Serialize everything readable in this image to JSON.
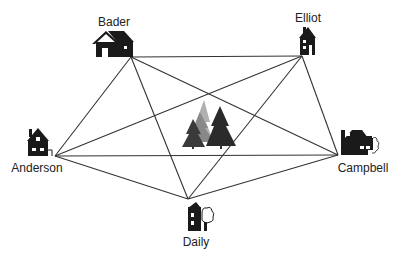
{
  "diagram": {
    "type": "complete-graph",
    "center_icon": "pine-trees-icon",
    "line_color": "#333333",
    "icon_color": "#1a1a1a",
    "nodes": [
      {
        "id": "bader",
        "label": "Bader",
        "icon": "house-icon",
        "x": 131,
        "y": 57
      },
      {
        "id": "elliot",
        "label": "Elliot",
        "icon": "house-icon",
        "x": 302,
        "y": 56
      },
      {
        "id": "anderson",
        "label": "Anderson",
        "icon": "house-icon",
        "x": 55,
        "y": 156
      },
      {
        "id": "campbell",
        "label": "Campbell",
        "icon": "house-icon",
        "x": 338,
        "y": 155
      },
      {
        "id": "daily",
        "label": "Daily",
        "icon": "house-icon",
        "x": 188,
        "y": 199
      }
    ],
    "edges": [
      [
        "bader",
        "elliot"
      ],
      [
        "bader",
        "anderson"
      ],
      [
        "bader",
        "campbell"
      ],
      [
        "bader",
        "daily"
      ],
      [
        "elliot",
        "anderson"
      ],
      [
        "elliot",
        "campbell"
      ],
      [
        "elliot",
        "daily"
      ],
      [
        "anderson",
        "campbell"
      ],
      [
        "anderson",
        "daily"
      ],
      [
        "campbell",
        "daily"
      ]
    ]
  }
}
